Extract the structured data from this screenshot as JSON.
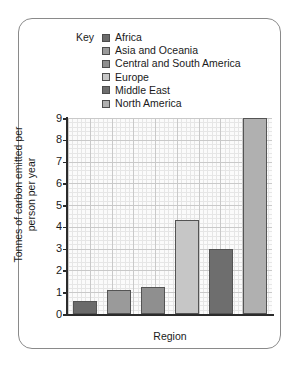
{
  "legend": {
    "title": "Key",
    "items": [
      {
        "label": "Africa",
        "color": "#6b6b6b"
      },
      {
        "label": "Asia and Oceania",
        "color": "#9a9a9a"
      },
      {
        "label": "Central and South America",
        "color": "#8f8f8f"
      },
      {
        "label": "Europe",
        "color": "#c6c6c6"
      },
      {
        "label": "Middle East",
        "color": "#6e6e6e"
      },
      {
        "label": "North America",
        "color": "#b0b0b0"
      }
    ]
  },
  "chart_data": {
    "type": "bar",
    "title": "",
    "xlabel": "Region",
    "ylabel": "Tonnes of carbon emitted per person per year",
    "categories": [
      "Africa",
      "Asia and Oceania",
      "Central and South America",
      "Europe",
      "Middle East",
      "North America"
    ],
    "values": [
      0.6,
      1.1,
      1.25,
      4.3,
      3.0,
      9.0
    ],
    "colors": [
      "#6b6b6b",
      "#9a9a9a",
      "#8f8f8f",
      "#c6c6c6",
      "#6e6e6e",
      "#b0b0b0"
    ],
    "ylim": [
      0,
      9
    ],
    "yticks": [
      0,
      1,
      2,
      3,
      4,
      5,
      6,
      7,
      8,
      9
    ],
    "ytick_labels": [
      "0",
      "1",
      "2",
      "3",
      "4",
      "5",
      "6",
      "7",
      "8",
      "9"
    ],
    "grid": true,
    "legend_position": "top"
  }
}
